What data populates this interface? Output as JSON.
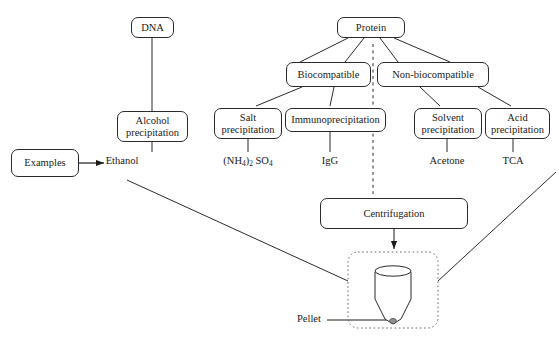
{
  "diagram": {
    "ink_color": "#2b2b2b",
    "text_color": "#1a1a1a",
    "nodes": {
      "dna": "DNA",
      "alcohol_precipitation": "Alcohol\nprecipitation",
      "examples": "Examples",
      "protein": "Protein",
      "biocompatible": "Biocompatible",
      "non_biocompatible": "Non-biocompatible",
      "salt_precipitation": "Salt\nprecipitation",
      "immunoprecipitation": "Immunoprecipitation",
      "solvent_precipitation": "Solvent\nprecipitation",
      "acid_precipitation": "Acid\nprecipitation",
      "centrifugation": "Centrifugation"
    },
    "labels": {
      "ethanol": "Ethanol",
      "ammonium_sulfate_prefix": "(NH",
      "ammonium_sulfate_sub1": "4",
      "ammonium_sulfate_mid": ")",
      "ammonium_sulfate_sub2": "2",
      "ammonium_sulfate_suffix": " SO",
      "ammonium_sulfate_sub3": "4",
      "igg": "IgG",
      "acetone": "Acetone",
      "tca": "TCA",
      "pellet": "Pellet"
    }
  }
}
